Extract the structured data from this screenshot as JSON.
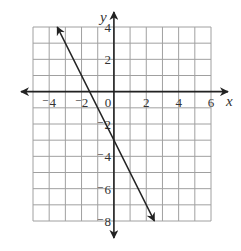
{
  "chart_data": {
    "type": "line",
    "title": "",
    "xlabel": "x",
    "ylabel": "y",
    "xlim": [
      -5,
      6
    ],
    "ylim": [
      -8,
      4
    ],
    "grid": true,
    "grid_step": 1,
    "x_ticks": [
      -4,
      -2,
      0,
      2,
      4,
      6
    ],
    "y_ticks": [
      4,
      2,
      -2,
      -4,
      -6,
      -8
    ],
    "x_tick_labels": [
      "⁻4",
      "⁻2",
      "0",
      "2",
      "4",
      "6"
    ],
    "y_tick_labels": [
      "4",
      "2",
      "⁻2",
      "⁻4",
      "⁻6",
      "⁻8"
    ],
    "series": [
      {
        "name": "line",
        "equation": "y = -2x - 3",
        "slope": -2,
        "intercept": -3,
        "x": [
          -3.5,
          2.5
        ],
        "y": [
          4,
          -8
        ],
        "arrows": "both"
      }
    ],
    "colors": {
      "grid": "#a0a0a0",
      "axis": "#222222",
      "line": "#222222"
    }
  }
}
